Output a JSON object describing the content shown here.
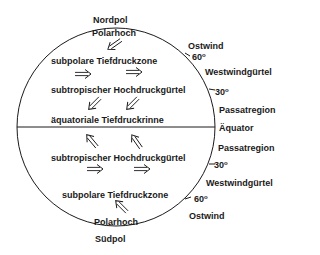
{
  "diagram": {
    "poles": {
      "north": "Nordpol",
      "south": "Südpol"
    },
    "inner_labels": {
      "polar_high_north": "Polarhoch",
      "subpolar_low_north": "subpolare Tiefdruckzone",
      "subtropical_high_north": "subtropischer Hochdruckgürtel",
      "equatorial_trough": "äquatoriale Tiefdruckrinne",
      "subtropical_high_south": "subtropischer Hochdruckgürtel",
      "subpolar_low_south": "subpolare Tiefdruckzone",
      "polar_high_south": "Polarhoch"
    },
    "outer_labels": {
      "east_wind_north": "Ostwind",
      "lat60_north": "60",
      "westerlies_north": "Westwindgürtel",
      "lat30_north": "30",
      "trade_north": "Passatregion",
      "equator": "Äquator",
      "trade_south": "Passatregion",
      "lat30_south": "30",
      "westerlies_south": "Westwindgürtel",
      "lat60_south": "60",
      "east_wind_south": "Ostwind",
      "degree": "o"
    },
    "arrows": [
      {
        "name": "polar-north-arrow",
        "direction": "southwest"
      },
      {
        "name": "westerly-north-arrow-1",
        "direction": "east"
      },
      {
        "name": "westerly-north-arrow-2",
        "direction": "east"
      },
      {
        "name": "trade-north-arrow-1",
        "direction": "southwest"
      },
      {
        "name": "trade-north-arrow-2",
        "direction": "southwest"
      },
      {
        "name": "trade-south-arrow-1",
        "direction": "northwest"
      },
      {
        "name": "trade-south-arrow-2",
        "direction": "northwest"
      },
      {
        "name": "westerly-south-arrow-1",
        "direction": "east"
      },
      {
        "name": "westerly-south-arrow-2",
        "direction": "east"
      },
      {
        "name": "polar-south-arrow",
        "direction": "northwest"
      }
    ]
  }
}
